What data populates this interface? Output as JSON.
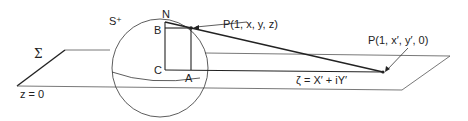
{
  "diagram": {
    "type": "stereographic-projection",
    "labels": {
      "sphere": "S⁺",
      "plane": "Σ",
      "plane_equation": "z = 0",
      "north_pole": "N",
      "point_b": "B",
      "point_c": "C",
      "point_a": "A",
      "point_on_sphere": "P(1, x, y, z)",
      "projected_point": "P(1, x′, y′, 0)",
      "complex_coordinate": "ζ = X′ + iY′"
    },
    "colors": {
      "stroke": "#222222",
      "plane_stroke": "#555555",
      "background": "#ffffff"
    }
  }
}
